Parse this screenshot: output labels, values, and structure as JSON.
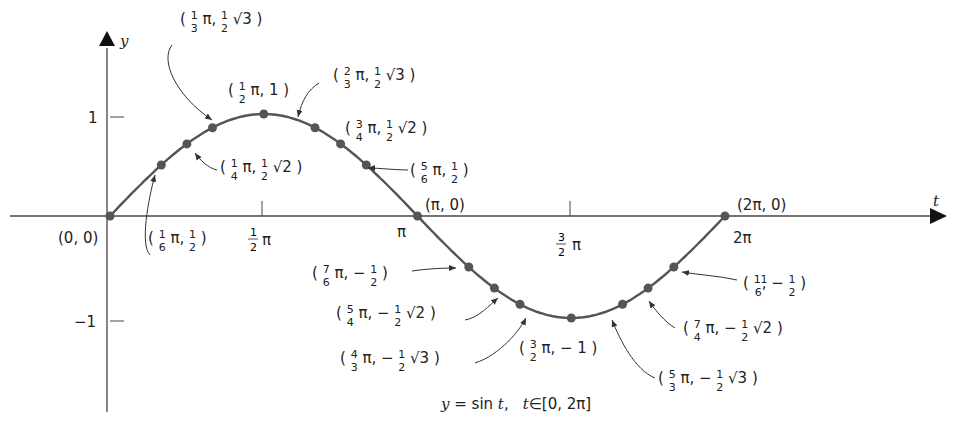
{
  "chart_data": {
    "type": "line",
    "function": "y = sin t",
    "domain": "[0, 2π]",
    "xlabel": "t",
    "ylabel": "y",
    "x_ticks": [
      "½π",
      "π",
      "3/2 π",
      "2π"
    ],
    "x_tick_values": [
      1.5708,
      3.1416,
      4.7124,
      6.2832
    ],
    "y_ticks": [
      "1",
      "−1"
    ],
    "y_tick_values": [
      1,
      -1
    ],
    "ylim": [
      -1.9,
      1.9
    ],
    "grid": false,
    "points": [
      {
        "t": "0",
        "y": "0",
        "t_val": 0,
        "y_val": 0,
        "label": "(0, 0)"
      },
      {
        "t": "1/6 π",
        "y": "1/2",
        "t_val": 0.5236,
        "y_val": 0.5,
        "label": "(1/6 π, 1/2)"
      },
      {
        "t": "1/4 π",
        "y": "1/2 √2",
        "t_val": 0.7854,
        "y_val": 0.7071,
        "label": "(1/4 π, 1/2 √2)"
      },
      {
        "t": "1/3 π",
        "y": "1/2 √3",
        "t_val": 1.0472,
        "y_val": 0.866,
        "label": "(1/3 π, 1/2 √3)"
      },
      {
        "t": "1/2 π",
        "y": "1",
        "t_val": 1.5708,
        "y_val": 1,
        "label": "(1/2 π, 1)"
      },
      {
        "t": "2/3 π",
        "y": "1/2 √3",
        "t_val": 2.0944,
        "y_val": 0.866,
        "label": "(2/3 π, 1/2 √3)"
      },
      {
        "t": "3/4 π",
        "y": "1/2 √2",
        "t_val": 2.3562,
        "y_val": 0.7071,
        "label": "(3/4 π, 1/2 √2)"
      },
      {
        "t": "5/6 π",
        "y": "1/2",
        "t_val": 2.618,
        "y_val": 0.5,
        "label": "(5/6 π, 1/2)"
      },
      {
        "t": "π",
        "y": "0",
        "t_val": 3.1416,
        "y_val": 0,
        "label": "(π, 0)"
      },
      {
        "t": "7/6 π",
        "y": "−1/2",
        "t_val": 3.6652,
        "y_val": -0.5,
        "label": "(7/6 π, − 1/2)"
      },
      {
        "t": "5/4 π",
        "y": "−1/2 √2",
        "t_val": 3.927,
        "y_val": -0.7071,
        "label": "(5/4 π, − 1/2 √2)"
      },
      {
        "t": "4/3 π",
        "y": "−1/2 √3",
        "t_val": 4.1888,
        "y_val": -0.866,
        "label": "(4/3 π, − 1/2 √3)"
      },
      {
        "t": "3/2 π",
        "y": "−1",
        "t_val": 4.7124,
        "y_val": -1,
        "label": "(3/2 π, − 1)"
      },
      {
        "t": "5/3 π",
        "y": "−1/2 √3",
        "t_val": 5.236,
        "y_val": -0.866,
        "label": "(5/3 π, − 1/2 √3)"
      },
      {
        "t": "7/4 π",
        "y": "−1/2 √2",
        "t_val": 5.4978,
        "y_val": -0.7071,
        "label": "(7/4 π, − 1/2 √2)"
      },
      {
        "t": "11/6",
        "y": "−1/2",
        "t_val": 5.7596,
        "y_val": -0.5,
        "label": "(11/6, − 1/2)"
      },
      {
        "t": "2π",
        "y": "0",
        "t_val": 6.2832,
        "y_val": 0,
        "label": "(2π, 0)"
      }
    ]
  },
  "axes": {
    "x_label": "t",
    "y_label": "y",
    "origin_label": "(0, 0)",
    "y_tick_1": "1",
    "y_tick_neg1": "−1",
    "x_tick_half_pi": {
      "num": "1",
      "den": "2",
      "sym": "π"
    },
    "x_tick_pi": "π",
    "x_tick_three_halves_pi": {
      "num": "3",
      "den": "2",
      "sym": "π"
    },
    "x_tick_2pi": "2π"
  },
  "labels": {
    "p_pi": "(π, 0)",
    "p_2pi": "(2π, 0)"
  },
  "caption": {
    "y": "y",
    "eq": " = sin ",
    "t": "t",
    "comma": ",",
    "t2": "t",
    "in": "∈",
    "interval": "[0, 2π]"
  }
}
